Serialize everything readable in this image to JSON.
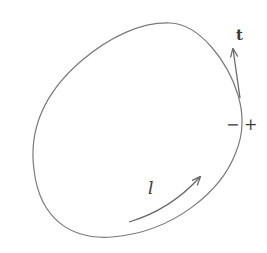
{
  "diagram": {
    "colors": {
      "stroke": "#7a7a7a",
      "text": "#3a3a3a",
      "background": "#ffffff"
    },
    "labels": {
      "tangent": "t",
      "minus_side": "−",
      "plus_side": "+",
      "curve_direction": "l"
    }
  }
}
